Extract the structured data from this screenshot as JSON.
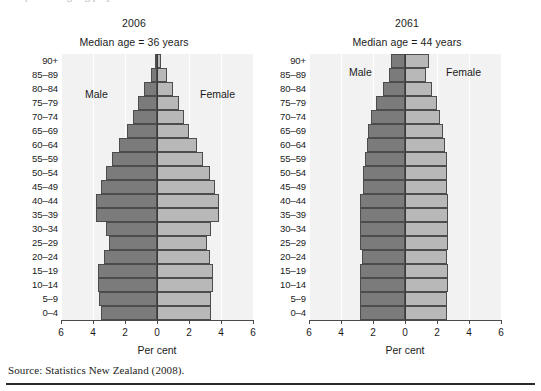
{
  "figure": {
    "clipped_title": "Population ageing projections",
    "source": "Source: Statistics New Zealand (2008)."
  },
  "axis": {
    "xlabel": "Per cent",
    "tick_labels": [
      "6",
      "4",
      "2",
      "0",
      "2",
      "4",
      "6"
    ],
    "legend_male": "Male",
    "legend_female": "Female"
  },
  "colors": {
    "male": "#7b7b7b",
    "female": "#b8b8b8",
    "panel": "#f2f2f2",
    "grid": "#ffffff",
    "axis": "#4a4a4a"
  },
  "panels": [
    {
      "year": "2006",
      "median": "Median age = 36 years"
    },
    {
      "year": "2061",
      "median": "Median age = 44 years"
    }
  ],
  "chart_data": [
    {
      "type": "bar",
      "title": "2006",
      "subtitle": "Median age = 36 years",
      "orientation": "population-pyramid",
      "xlabel": "Per cent",
      "ylabel": "",
      "xlim": [
        -6,
        6
      ],
      "xticks": [
        -6,
        -4,
        -2,
        0,
        2,
        4,
        6
      ],
      "xticklabels": [
        "6",
        "4",
        "2",
        "0",
        "2",
        "4",
        "6"
      ],
      "grid": true,
      "legend_position": "inside-plot",
      "categories": [
        "0–4",
        "5–9",
        "10–14",
        "15–19",
        "20–24",
        "25–29",
        "30–34",
        "35–39",
        "40–44",
        "45–49",
        "50–54",
        "55–59",
        "60–64",
        "65–69",
        "70–74",
        "75–79",
        "80–84",
        "85–89",
        "90+"
      ],
      "series": [
        {
          "name": "Male",
          "values": [
            3.5,
            3.6,
            3.7,
            3.7,
            3.3,
            3.0,
            3.2,
            3.8,
            3.8,
            3.5,
            3.2,
            2.8,
            2.4,
            1.9,
            1.5,
            1.2,
            0.8,
            0.4,
            0.15
          ]
        },
        {
          "name": "Female",
          "values": [
            3.4,
            3.4,
            3.5,
            3.5,
            3.3,
            3.1,
            3.4,
            3.9,
            3.9,
            3.6,
            3.3,
            2.9,
            2.5,
            2.0,
            1.7,
            1.4,
            1.0,
            0.6,
            0.25
          ]
        }
      ]
    },
    {
      "type": "bar",
      "title": "2061",
      "subtitle": "Median age = 44 years",
      "orientation": "population-pyramid",
      "xlabel": "Per cent",
      "ylabel": "",
      "xlim": [
        -6,
        6
      ],
      "xticks": [
        -6,
        -4,
        -2,
        0,
        2,
        4,
        6
      ],
      "xticklabels": [
        "6",
        "4",
        "2",
        "0",
        "2",
        "4",
        "6"
      ],
      "grid": true,
      "legend_position": "inside-plot",
      "categories": [
        "0–4",
        "5–9",
        "10–14",
        "15–19",
        "20–24",
        "25–29",
        "30–34",
        "35–39",
        "40–44",
        "45–49",
        "50–54",
        "55–59",
        "60–64",
        "65–69",
        "70–74",
        "75–79",
        "80–84",
        "85–89",
        "90+"
      ],
      "series": [
        {
          "name": "Male",
          "values": [
            2.8,
            2.8,
            2.8,
            2.8,
            2.7,
            2.8,
            2.8,
            2.8,
            2.8,
            2.6,
            2.6,
            2.5,
            2.4,
            2.3,
            2.1,
            1.8,
            1.4,
            1.0,
            0.9
          ]
        },
        {
          "name": "Female",
          "values": [
            2.6,
            2.6,
            2.7,
            2.7,
            2.6,
            2.7,
            2.7,
            2.7,
            2.7,
            2.6,
            2.6,
            2.6,
            2.5,
            2.4,
            2.2,
            2.0,
            1.7,
            1.3,
            1.5
          ]
        }
      ]
    }
  ]
}
